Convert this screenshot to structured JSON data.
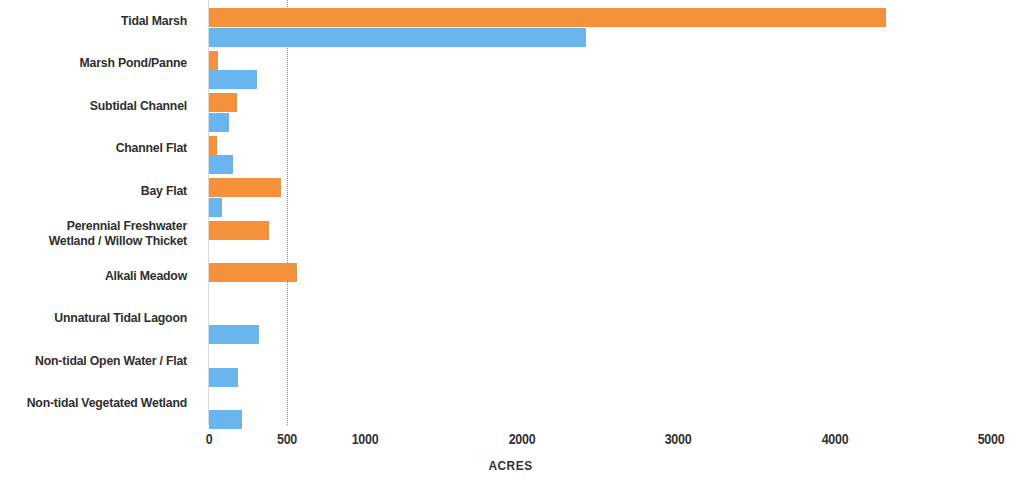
{
  "chart_data": {
    "type": "bar",
    "orientation": "horizontal",
    "title": "",
    "xlabel": "ACRES",
    "ylabel": "",
    "xlim": [
      0,
      5000
    ],
    "xticks": [
      0,
      500,
      1000,
      2000,
      3000,
      4000,
      5000
    ],
    "xtick_labels": [
      "0",
      "500",
      "1000",
      "2000",
      "3000",
      "4000",
      "5000"
    ],
    "grid": "dotted vertical gridline at 500",
    "gridline_values": [
      500
    ],
    "legend": "none",
    "categories": [
      "Tidal Marsh",
      "Marsh Pond/Panne",
      "Subtidal Channel",
      "Channel Flat",
      "Bay Flat",
      "Perennial Freshwater\nWetland / Willow Thicket",
      "Alkali Meadow",
      "Unnatural Tidal Lagoon",
      "Non-tidal Open Water / Flat",
      "Non-tidal Vegetated Wetland"
    ],
    "series": [
      {
        "name": "orange-series",
        "color": "#f5903b",
        "values": [
          4330,
          57,
          180,
          50,
          461,
          385,
          565,
          0,
          0,
          0
        ]
      },
      {
        "name": "blue-series",
        "color": "#69b5ed",
        "values": [
          2410,
          307,
          131,
          156,
          81,
          0,
          0,
          322,
          185,
          212
        ]
      }
    ]
  },
  "axis": {
    "title": "ACRES"
  },
  "colors": {
    "orange": "#f5903b",
    "blue": "#69b5ed",
    "gridline": "#8e8e8e",
    "axis": "#d9d9d9",
    "text": "#2f2f2f",
    "background": "#ffffff"
  }
}
